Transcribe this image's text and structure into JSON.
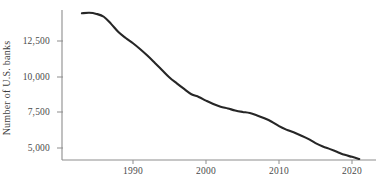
{
  "chart_data": {
    "type": "line",
    "title": "",
    "xlabel": "",
    "ylabel": "Number of U.S. banks",
    "xlim": [
      1983,
      2021
    ],
    "ylim": [
      4000,
      15000
    ],
    "grid": false,
    "legend": false,
    "line_color": "#262626",
    "xticks": [
      1990,
      2000,
      2010,
      2020
    ],
    "xtick_labels": [
      "1990",
      "2000",
      "2010",
      "2020"
    ],
    "yticks": [
      5000,
      7500,
      10000,
      12500
    ],
    "ytick_labels": [
      "5,000",
      "7,500",
      "10,000",
      "12,500"
    ],
    "series": [
      {
        "name": "Number of U.S. banks",
        "x": [
          1983,
          1984,
          1985,
          1986,
          1987,
          1988,
          1989,
          1990,
          1991,
          1992,
          1993,
          1994,
          1995,
          1996,
          1997,
          1998,
          1999,
          2000,
          2001,
          2002,
          2003,
          2004,
          2005,
          2006,
          2007,
          2008,
          2009,
          2010,
          2011,
          2012,
          2013,
          2014,
          2015,
          2016,
          2017,
          2018,
          2019,
          2020,
          2021
        ],
        "values": [
          14440,
          14480,
          14400,
          14200,
          13700,
          13130,
          12710,
          12340,
          11920,
          11460,
          10960,
          10450,
          9940,
          9530,
          9140,
          8770,
          8580,
          8320,
          8080,
          7890,
          7770,
          7630,
          7530,
          7450,
          7280,
          7080,
          6840,
          6530,
          6290,
          6100,
          5880,
          5640,
          5340,
          5110,
          4920,
          4720,
          4520,
          4380,
          4230
        ]
      }
    ]
  },
  "axis": {
    "y_label": "Number of U.S. banks",
    "x_label": ""
  }
}
